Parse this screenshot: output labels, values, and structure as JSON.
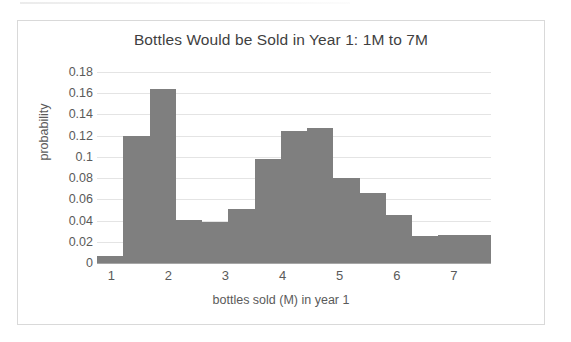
{
  "chart_data": {
    "type": "bar",
    "title": "Bottles Would be Sold in Year 1:  1M to 7M",
    "xlabel": "bottles sold (M) in year 1",
    "ylabel": "probability",
    "xlim": [
      0.75,
      7.65
    ],
    "ylim": [
      0,
      0.18
    ],
    "grid": true,
    "legend": false,
    "bin_width": 0.46,
    "bar_color": "#7f7f7f",
    "gridline_color": "#e4e4e4",
    "axis_color": "#a6a6a6",
    "text_color": "#5a5a5a",
    "y_ticks": [
      "0",
      "0.02",
      "0.04",
      "0.06",
      "0.08",
      "0.1",
      "0.12",
      "0.14",
      "0.16",
      "0.18"
    ],
    "y_tick_values": [
      0,
      0.02,
      0.04,
      0.06,
      0.08,
      0.1,
      0.12,
      0.14,
      0.16,
      0.18
    ],
    "x_ticks": [
      "1",
      "2",
      "3",
      "4",
      "5",
      "6",
      "7"
    ],
    "x_tick_values": [
      1,
      2,
      3,
      4,
      5,
      6,
      7
    ],
    "bins": [
      {
        "x_start": 0.75,
        "x_end": 1.21,
        "value": 0.007
      },
      {
        "x_start": 1.21,
        "x_end": 1.67,
        "value": 0.12
      },
      {
        "x_start": 1.67,
        "x_end": 2.13,
        "value": 0.164
      },
      {
        "x_start": 2.13,
        "x_end": 2.59,
        "value": 0.041
      },
      {
        "x_start": 2.59,
        "x_end": 3.05,
        "value": 0.039
      },
      {
        "x_start": 3.05,
        "x_end": 3.51,
        "value": 0.051
      },
      {
        "x_start": 3.51,
        "x_end": 3.97,
        "value": 0.098
      },
      {
        "x_start": 3.97,
        "x_end": 4.43,
        "value": 0.124
      },
      {
        "x_start": 4.43,
        "x_end": 4.89,
        "value": 0.127
      },
      {
        "x_start": 4.89,
        "x_end": 5.35,
        "value": 0.08
      },
      {
        "x_start": 5.35,
        "x_end": 5.81,
        "value": 0.066
      },
      {
        "x_start": 5.81,
        "x_end": 6.27,
        "value": 0.045
      },
      {
        "x_start": 6.27,
        "x_end": 6.73,
        "value": 0.025
      },
      {
        "x_start": 6.73,
        "x_end": 7.65,
        "value": 0.026
      }
    ],
    "categories": [
      "0.75-1.21",
      "1.21-1.67",
      "1.67-2.13",
      "2.13-2.59",
      "2.59-3.05",
      "3.05-3.51",
      "3.51-3.97",
      "3.97-4.43",
      "4.43-4.89",
      "4.89-5.35",
      "5.35-5.81",
      "5.81-6.27",
      "6.27-6.73",
      "6.73-7.65"
    ],
    "values": [
      0.007,
      0.12,
      0.164,
      0.041,
      0.039,
      0.051,
      0.098,
      0.124,
      0.127,
      0.08,
      0.066,
      0.045,
      0.025,
      0.026
    ]
  }
}
